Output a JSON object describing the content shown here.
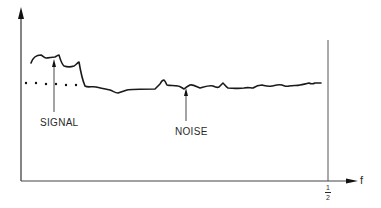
{
  "diagram": {
    "type": "spectrum-sketch",
    "x_axis_label": "f",
    "x_tick": {
      "numerator": "1",
      "denominator": "2"
    },
    "annotations": [
      {
        "label": "SIGNAL"
      },
      {
        "label": "NOISE"
      }
    ],
    "colors": {
      "line": "#1a1a1a",
      "axis": "#333333",
      "text": "#2a2a2a",
      "background": "#ffffff"
    }
  }
}
